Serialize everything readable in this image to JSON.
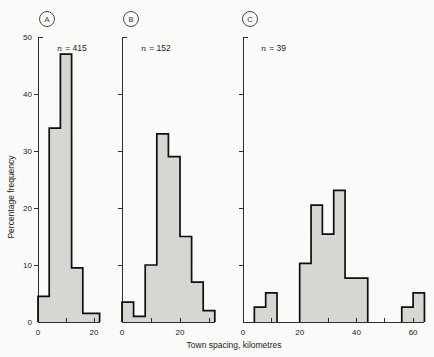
{
  "figure": {
    "xlabel": "Town spacing, kilometres",
    "ylabel": "Percentage frequency"
  },
  "colors": {
    "bar_fill": "#d7d6d3",
    "bar_outline": "#0e0e0e",
    "axis": "#2e2e2e",
    "background": "#fafaf8"
  },
  "chart_data": [
    {
      "type": "bar",
      "subtype": "histogram",
      "panel_label": "A",
      "annotation": {
        "symbol": "n",
        "value": "= 415"
      },
      "n": 415,
      "ylim": [
        0,
        50
      ],
      "yticks": [
        0,
        10,
        20,
        30,
        40,
        50
      ],
      "show_ytick_labels": true,
      "xticks": [
        0,
        10,
        20
      ],
      "xtick_labeled": [
        0,
        20
      ],
      "x_axis_end": 22,
      "segments": [
        {
          "bin_edges": [
            0,
            4,
            8,
            12,
            16,
            22
          ],
          "values": [
            4.5,
            34,
            47,
            9.5,
            1.5
          ]
        }
      ]
    },
    {
      "type": "bar",
      "subtype": "histogram",
      "panel_label": "B",
      "annotation": {
        "symbol": "n",
        "value": "= 152"
      },
      "n": 152,
      "ylim": [
        0,
        50
      ],
      "yticks": [
        0,
        10,
        20,
        30,
        40,
        50
      ],
      "show_ytick_labels": false,
      "xticks": [
        0,
        10,
        20,
        30
      ],
      "xtick_labeled": [
        0,
        20
      ],
      "x_axis_end": 32,
      "segments": [
        {
          "bin_edges": [
            0,
            4,
            8,
            12,
            16,
            20,
            24,
            28,
            32
          ],
          "values": [
            3.5,
            1,
            10,
            33,
            29,
            15,
            7,
            2
          ]
        }
      ]
    },
    {
      "type": "bar",
      "subtype": "histogram",
      "panel_label": "C",
      "annotation": {
        "symbol": "n",
        "value": "= 39"
      },
      "n": 39,
      "ylim": [
        0,
        50
      ],
      "yticks": [
        0,
        10,
        20,
        30,
        40,
        50
      ],
      "show_ytick_labels": false,
      "xticks": [
        0,
        10,
        20,
        30,
        40,
        50,
        60
      ],
      "xtick_labeled": [
        0,
        20,
        40,
        60
      ],
      "x_axis_end": 64,
      "segments": [
        {
          "bin_edges": [
            4,
            8,
            12
          ],
          "values": [
            2.6,
            5.1
          ]
        },
        {
          "bin_edges": [
            20,
            24,
            28,
            32,
            36,
            44
          ],
          "values": [
            10.3,
            20.5,
            15.4,
            23.1,
            7.7
          ]
        },
        {
          "bin_edges": [
            56,
            60,
            64
          ],
          "values": [
            2.6,
            5.1
          ]
        }
      ]
    }
  ]
}
